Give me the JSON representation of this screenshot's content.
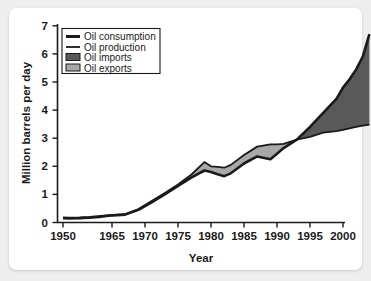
{
  "chart_data": {
    "type": "area",
    "title": "",
    "subtitle": "",
    "xlabel": "Year",
    "ylabel": "Million barrels per day",
    "xlim": [
      1950,
      2004
    ],
    "ylim": [
      0,
      7
    ],
    "grid": false,
    "legend_position": "top-left",
    "xticks": [
      "1950",
      "1965",
      "1970",
      "1975",
      "1980",
      "1985",
      "1990",
      "1995",
      "2000"
    ],
    "xtick_values": [
      1950,
      1965,
      1970,
      1975,
      1980,
      1985,
      1990,
      1995,
      2000
    ],
    "yticks": [
      "0",
      "1",
      "2",
      "3",
      "4",
      "5",
      "6",
      "7"
    ],
    "ytick_values": [
      0,
      1,
      2,
      3,
      4,
      5,
      6,
      7
    ],
    "legend": [
      {
        "label": "Oil consumption",
        "type": "line",
        "color": "#1a1a1a",
        "width": 3
      },
      {
        "label": "Oil production",
        "type": "line",
        "color": "#1a1a1a",
        "width": 2
      },
      {
        "label": "Oil imports",
        "type": "area",
        "color": "#595959"
      },
      {
        "label": "Oil exports",
        "type": "area",
        "color": "#a8a8a8"
      }
    ],
    "x": [
      1950,
      1952,
      1955,
      1958,
      1961,
      1964,
      1967,
      1969,
      1971,
      1973,
      1975,
      1977,
      1979,
      1980,
      1981,
      1982,
      1983,
      1985,
      1987,
      1989,
      1990,
      1991,
      1993,
      1995,
      1997,
      1999,
      2000,
      2001,
      2002,
      2003,
      2004
    ],
    "series": [
      {
        "name": "Oil consumption",
        "values": [
          0.15,
          0.14,
          0.15,
          0.17,
          0.2,
          0.24,
          0.28,
          0.45,
          0.72,
          1.0,
          1.3,
          1.6,
          1.85,
          1.8,
          1.72,
          1.65,
          1.75,
          2.1,
          2.35,
          2.25,
          2.45,
          2.65,
          2.95,
          3.4,
          3.9,
          4.4,
          4.8,
          5.1,
          5.45,
          5.9,
          6.7
        ]
      },
      {
        "name": "Oil production",
        "values": [
          0.18,
          0.17,
          0.18,
          0.2,
          0.23,
          0.26,
          0.3,
          0.48,
          0.76,
          1.05,
          1.35,
          1.7,
          2.15,
          2.0,
          1.98,
          1.95,
          2.05,
          2.4,
          2.7,
          2.78,
          2.78,
          2.8,
          2.95,
          3.05,
          3.2,
          3.25,
          3.3,
          3.35,
          3.4,
          3.45,
          3.48
        ]
      }
    ],
    "bands": [
      {
        "name": "Oil exports",
        "description": "Production exceeds consumption (shaded light gray)",
        "x_range": [
          1950,
          1993
        ],
        "color": "#a8a8a8"
      },
      {
        "name": "Oil imports",
        "description": "Consumption exceeds production (shaded dark gray)",
        "x_range": [
          1993,
          2004
        ],
        "color": "#595959"
      }
    ]
  }
}
